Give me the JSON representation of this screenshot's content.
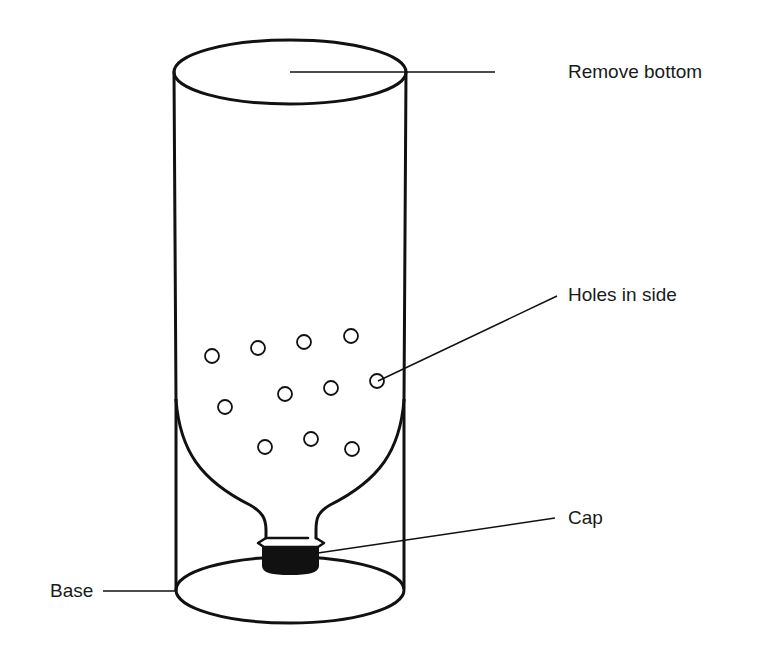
{
  "diagram": {
    "colors": {
      "stroke": "#111111",
      "background": "#ffffff",
      "cap_fill": "#111111"
    },
    "labels": {
      "remove_bottom": "Remove bottom",
      "holes_in_side": "Holes in side",
      "cap": "Cap",
      "base": "Base"
    },
    "holes": [
      {
        "x": 212,
        "y": 356
      },
      {
        "x": 258,
        "y": 348
      },
      {
        "x": 304,
        "y": 342
      },
      {
        "x": 351,
        "y": 336
      },
      {
        "x": 285,
        "y": 394
      },
      {
        "x": 331,
        "y": 388
      },
      {
        "x": 377,
        "y": 381
      },
      {
        "x": 225,
        "y": 407
      },
      {
        "x": 265,
        "y": 447
      },
      {
        "x": 311,
        "y": 439
      },
      {
        "x": 352,
        "y": 449
      }
    ]
  }
}
